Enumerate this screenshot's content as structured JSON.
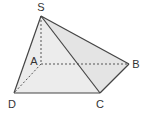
{
  "diagram": {
    "vertices": {
      "S": {
        "label": "S",
        "x": 41,
        "y": 16,
        "lx": 41,
        "ly": 11
      },
      "A": {
        "label": "A",
        "x": 41,
        "y": 64,
        "lx": 34,
        "ly": 65
      },
      "B": {
        "label": "B",
        "x": 129,
        "y": 64,
        "lx": 136,
        "ly": 68
      },
      "C": {
        "label": "C",
        "x": 100,
        "y": 93,
        "lx": 100,
        "ly": 108
      },
      "D": {
        "label": "D",
        "x": 14,
        "y": 93,
        "lx": 12,
        "ly": 108
      }
    },
    "solid_edges": [
      "SD",
      "SC",
      "SB",
      "DC",
      "CB"
    ],
    "dashed_edges": [
      "SA",
      "AB",
      "AD"
    ],
    "colors": {
      "edge": "#444444",
      "face_light": "#ececec",
      "face_mid": "#e2e2e2",
      "label": "#333333"
    }
  }
}
